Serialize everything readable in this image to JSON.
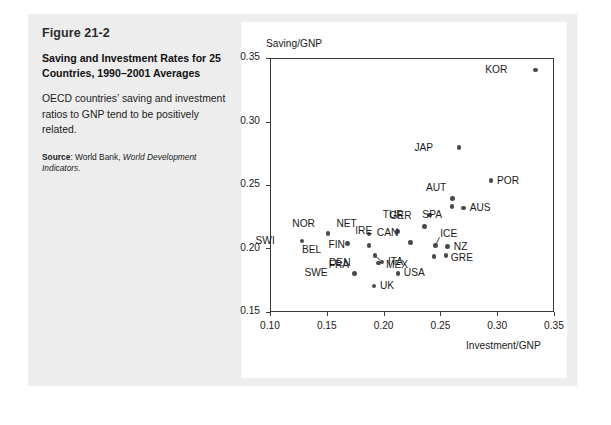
{
  "figure": {
    "number": "Figure 21-2",
    "title": "Saving and Investment Rates for 25 Countries, 1990–2001 Averages",
    "description": "OECD countries’ saving and investment ratios to GNP tend to be positively related.",
    "source_label": "Source",
    "source_sep": ": ",
    "source_text": "World Bank, ",
    "source_italic": "World Development Indicators."
  },
  "chart_data": {
    "type": "scatter",
    "title": "Saving and Investment Rates for 25 Countries, 1990–2001 Averages",
    "xlabel": "Investment/GNP",
    "ylabel": "Saving/GNP",
    "xlim": [
      0.1,
      0.35
    ],
    "ylim": [
      0.15,
      0.35
    ],
    "xticks": [
      "0.10",
      "0.15",
      "0.20",
      "0.25",
      "0.30",
      "0.35"
    ],
    "yticks": [
      "0.15",
      "0.20",
      "0.25",
      "0.30",
      "0.35"
    ],
    "xtick_values": [
      0.1,
      0.15,
      0.2,
      0.25,
      0.3,
      0.35
    ],
    "ytick_values": [
      0.15,
      0.2,
      0.25,
      0.3,
      0.35
    ],
    "grid": false,
    "legend": null,
    "points": [
      {
        "name": "SWI",
        "x": 0.128,
        "y": 0.206,
        "lx": -27,
        "ly": -6
      },
      {
        "name": "NOR",
        "x": 0.151,
        "y": 0.212,
        "lx": -13,
        "ly": -15
      },
      {
        "name": "BEL",
        "x": 0.168,
        "y": 0.204,
        "lx": -26,
        "ly": 1
      },
      {
        "name": "NET",
        "x": 0.187,
        "y": 0.2115,
        "lx": -12,
        "ly": -16
      },
      {
        "name": "FIN",
        "x": 0.187,
        "y": 0.2025,
        "lx": -24,
        "ly": -6
      },
      {
        "name": "IRE",
        "x": 0.212,
        "y": 0.2135,
        "lx": -25,
        "ly": -6
      },
      {
        "name": "GER",
        "x": 0.236,
        "y": 0.2175,
        "lx": -13,
        "ly": -16
      },
      {
        "name": "DEN",
        "x": 0.1955,
        "y": 0.1885,
        "lx": -28,
        "ly": -6
      },
      {
        "name": "ITA",
        "x": 0.1985,
        "y": 0.1895,
        "lx": 6,
        "ly": -6
      },
      {
        "name": "FRA",
        "x": 0.1925,
        "y": 0.1945,
        "lx": -26,
        "ly": 4,
        "leader": {
          "tx": 0.1975,
          "ty": 0.1905
        }
      },
      {
        "name": "CAN",
        "x": 0.2235,
        "y": 0.2045,
        "lx": -12,
        "ly": -16
      },
      {
        "name": "SWE",
        "x": 0.1745,
        "y": 0.1805,
        "lx": -27,
        "ly": -6
      },
      {
        "name": "USA",
        "x": 0.2125,
        "y": 0.1805,
        "lx": 6,
        "ly": -6
      },
      {
        "name": "UK",
        "x": 0.1915,
        "y": 0.1705,
        "lx": 6,
        "ly": -6
      },
      {
        "name": "MEX",
        "x": 0.2445,
        "y": 0.1935,
        "lx": -26,
        "ly": 2
      },
      {
        "name": "ICE",
        "x": 0.2455,
        "y": 0.2025,
        "lx": 5,
        "ly": -17,
        "leader": {
          "tx": 0.249,
          "ty": 0.2085
        }
      },
      {
        "name": "NZ",
        "x": 0.2565,
        "y": 0.2015,
        "lx": 6,
        "ly": -6
      },
      {
        "name": "GRE",
        "x": 0.2548,
        "y": 0.1945,
        "lx": 5,
        "ly": -3
      },
      {
        "name": "TUR",
        "x": 0.2405,
        "y": 0.2265,
        "lx": -26,
        "ly": -6
      },
      {
        "name": "AUT",
        "x": 0.2605,
        "y": 0.2395,
        "lx": -6,
        "ly": -16
      },
      {
        "name": "SPA",
        "x": 0.2602,
        "y": 0.233,
        "lx": -10,
        "ly": 2
      },
      {
        "name": "AUS",
        "x": 0.2705,
        "y": 0.232,
        "lx": 6,
        "ly": -6
      },
      {
        "name": "POR",
        "x": 0.2945,
        "y": 0.2535,
        "lx": 6,
        "ly": -6
      },
      {
        "name": "JAP",
        "x": 0.2665,
        "y": 0.2795,
        "lx": -26,
        "ly": -6
      },
      {
        "name": "KOR",
        "x": 0.3335,
        "y": 0.3405,
        "lx": -28,
        "ly": -6
      }
    ]
  },
  "colors": {
    "panel_bg": "#ededed",
    "card_bg": "#ffffff",
    "axis": "#3a3a3a",
    "point": "#4a4a4a",
    "text": "#1a1a1a"
  }
}
